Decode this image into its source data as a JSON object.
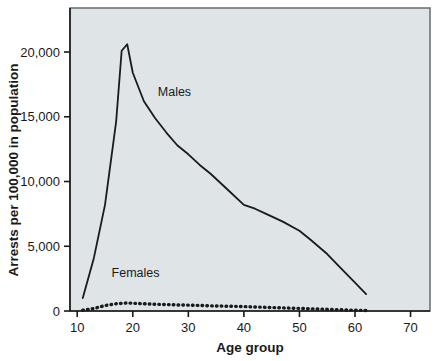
{
  "chart_data": {
    "type": "line",
    "title": "",
    "xlabel": "Age group",
    "ylabel": "Arrests per 100,000 in population",
    "xlim": [
      8.7,
      73.5
    ],
    "ylim": [
      0,
      23400
    ],
    "xticks": [
      10,
      20,
      30,
      40,
      50,
      60,
      70
    ],
    "xtick_labels": [
      "10",
      "20",
      "30",
      "40",
      "50",
      "60",
      "70"
    ],
    "yticks": [
      0,
      5000,
      10000,
      15000,
      20000
    ],
    "ytick_labels": [
      "0",
      "5,000",
      "10,000",
      "15,000",
      "20,000"
    ],
    "grid": false,
    "legend_position": "inline-annotations",
    "plot_background": "#dfe4e7",
    "frame_color": "#6e7478",
    "series": [
      {
        "name": "Males",
        "label_text": "Males",
        "label_x": 27.5,
        "label_y": 16600,
        "line_style": "solid",
        "color": "#1a1a1a",
        "width": 1.8,
        "x": [
          11,
          13,
          15,
          17,
          18,
          19,
          20,
          22,
          24,
          26,
          28,
          30,
          32,
          34,
          37,
          40,
          42,
          44,
          47,
          50,
          52,
          55,
          57,
          60,
          62
        ],
        "values": [
          1000,
          4100,
          8200,
          14600,
          20100,
          20600,
          18400,
          16200,
          14900,
          13800,
          12800,
          12100,
          11300,
          10600,
          9400,
          8200,
          7900,
          7500,
          6900,
          6200,
          5500,
          4400,
          3500,
          2200,
          1300
        ]
      },
      {
        "name": "Females",
        "label_text": "Females",
        "label_x": 20.5,
        "label_y": 2650,
        "line_style": "dotted",
        "color": "#1a1a1a",
        "width": 3.4,
        "x": [
          11,
          13,
          15,
          17,
          19,
          20,
          22,
          24,
          26,
          28,
          30,
          32,
          34,
          37,
          40,
          42,
          44,
          47,
          50,
          52,
          55,
          57,
          60,
          62
        ],
        "values": [
          60,
          190,
          420,
          560,
          620,
          600,
          560,
          520,
          500,
          470,
          450,
          430,
          400,
          370,
          340,
          310,
          280,
          240,
          200,
          170,
          130,
          100,
          60,
          40
        ]
      }
    ]
  }
}
